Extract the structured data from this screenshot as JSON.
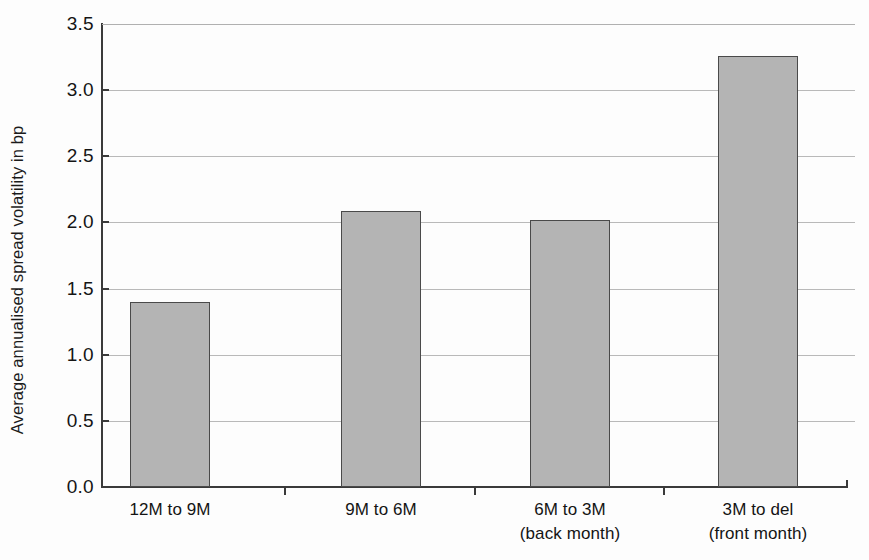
{
  "chart_data": {
    "type": "bar",
    "title": "",
    "subtitle": "",
    "xlabel": "",
    "ylabel": "Average annualised spread volatility in bp",
    "ylim": [
      0.0,
      3.5
    ],
    "ytick_labels": [
      "3.5",
      "3.0",
      "2.5",
      "2.0",
      "1.5",
      "1.0",
      "0.5",
      "0.0"
    ],
    "ytick_values": [
      3.5,
      3.0,
      2.5,
      2.0,
      1.5,
      1.0,
      0.5,
      0.0
    ],
    "grid": true,
    "legend": false,
    "legend_position": "none",
    "categories": [
      "12M to 9M",
      "9M to 6M",
      "6M to 3M",
      "3M to del"
    ],
    "category_sublabels": [
      "",
      "",
      "(back month)",
      "(front month)"
    ],
    "values": [
      1.4,
      2.09,
      2.02,
      3.26
    ],
    "bar_color": "#b4b4b4",
    "bar_edge_color": "#4a4a4a",
    "gridline_color": "#b9b9b9",
    "axis_color": "#3a3a3a",
    "background_color": "#fdfdfd",
    "annotations": []
  }
}
